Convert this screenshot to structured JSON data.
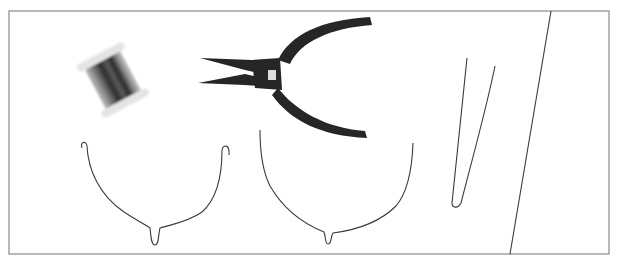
{
  "illustration": {
    "description": "Wire-working tools and underwire shapes",
    "frame_color": "#8a8a8a",
    "stroke_color": "#3a3a3a",
    "pliers_color": "#262626",
    "items": [
      {
        "name": "wire-spool"
      },
      {
        "name": "needle-nose-pliers"
      },
      {
        "name": "underwire-small"
      },
      {
        "name": "underwire-large"
      },
      {
        "name": "bent-wire-v"
      },
      {
        "name": "diagonal-line"
      }
    ]
  }
}
